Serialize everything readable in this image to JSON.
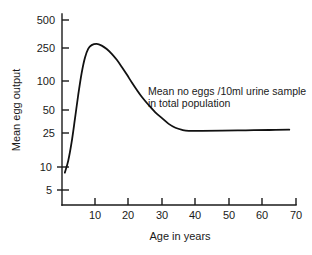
{
  "chart_data": {
    "type": "line",
    "title": "",
    "xlabel": "Age in years",
    "ylabel": "Mean egg output",
    "yscale": "log",
    "xscale": "linear",
    "grid": false,
    "legend": "none",
    "xlim": [
      0,
      70
    ],
    "ylim": [
      5,
      500
    ],
    "x_ticks": [
      10,
      20,
      30,
      40,
      50,
      60,
      70
    ],
    "x_tick_labels": [
      "10",
      "20",
      "30",
      "40",
      "50",
      "60",
      "70"
    ],
    "y_ticks": [
      5,
      10,
      25,
      50,
      100,
      250,
      500
    ],
    "y_tick_labels": [
      "5",
      "10",
      "25",
      "50",
      "100",
      "250",
      "500"
    ],
    "annotations": [
      {
        "name": "curve-annotation",
        "line1": "Mean no eggs /10ml urine sample",
        "line2": "in total population",
        "x": 31,
        "y": 70
      }
    ],
    "series": [
      {
        "name": "Mean no eggs /10ml urine sample in total population",
        "color": "#111111",
        "x": [
          1.0,
          2.0,
          3.0,
          4.0,
          5.0,
          6.0,
          7.0,
          8.0,
          9.0,
          10.5,
          12.0,
          13.5,
          15.0,
          16.5,
          18.0,
          19.5,
          21.0,
          22.5,
          24.0,
          26.0,
          28.0,
          30.0,
          32.0,
          34.0,
          36.0,
          38.0,
          42.0,
          48.0,
          55.0,
          62.0,
          68.0
        ],
        "y": [
          8,
          11,
          18,
          34,
          66,
          118,
          180,
          230,
          253,
          262,
          250,
          228,
          200,
          170,
          140,
          114,
          92,
          75,
          62,
          50,
          41,
          35,
          30,
          27,
          25.5,
          24.8,
          24.8,
          25.0,
          25.2,
          25.4,
          25.6
        ]
      }
    ]
  },
  "axis": {
    "y_title": "Mean egg output",
    "x_title": "Age in years"
  }
}
